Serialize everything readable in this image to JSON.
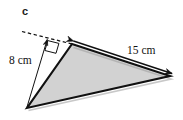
{
  "figure": {
    "part_label": "c",
    "shape_name": "triangle",
    "fill_color": "#d2d2d2",
    "stroke_color": "#111111",
    "background_color": "#ffffff",
    "labels": {
      "height": "8 cm",
      "side": "15 cm"
    },
    "measurements": [
      {
        "name": "height",
        "value": 8,
        "unit": "cm",
        "text": "8 cm"
      },
      {
        "name": "base",
        "value": 15,
        "unit": "cm",
        "text": "15 cm"
      }
    ],
    "annotations": {
      "right_angle_marker": true,
      "dashed_extension_line": true,
      "height_arrow": true,
      "side_double_arrow": true
    },
    "geometry": {
      "vertices": {
        "top": [
          72,
          44
        ],
        "right": [
          170,
          76
        ],
        "bottom_left": [
          27,
          108
        ]
      },
      "dashed_line": [
        [
          22,
          32
        ],
        [
          76,
          44
        ]
      ],
      "height_line": [
        [
          27,
          108
        ],
        [
          47,
          38
        ]
      ]
    }
  }
}
